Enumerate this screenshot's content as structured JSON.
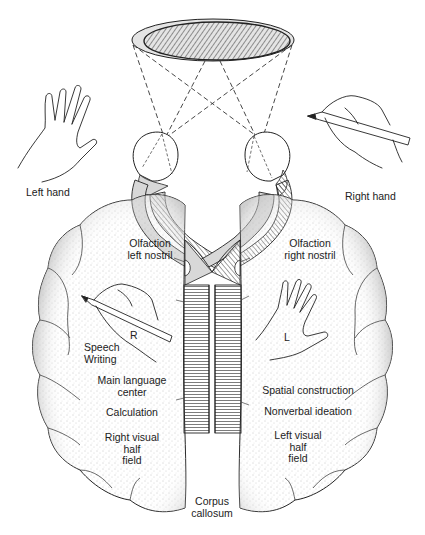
{
  "diagram": {
    "outside_labels": {
      "left_hand": "Left hand",
      "right_hand": "Right hand"
    },
    "left_hemisphere": {
      "olfaction": [
        "Olfaction",
        "left nostril"
      ],
      "hand_letter": "R",
      "speech_writing": [
        "Speech",
        "Writing"
      ],
      "main_language": [
        "Main language",
        "center"
      ],
      "calculation": "Calculation",
      "visual_field": [
        "Right visual",
        "half",
        "field"
      ]
    },
    "right_hemisphere": {
      "olfaction": [
        "Olfaction",
        "right nostril"
      ],
      "hand_letter": "L",
      "spatial": "Spatial construction",
      "nonverbal": "Nonverbal ideation",
      "visual_field": [
        "Left visual",
        "half",
        "field"
      ]
    },
    "center": {
      "corpus_callosum": [
        "Corpus",
        "callosum"
      ]
    },
    "colors": {
      "line": "#222222",
      "shade": "#d8d8d8",
      "hatch": "#333333",
      "stipple": "#999999"
    }
  }
}
